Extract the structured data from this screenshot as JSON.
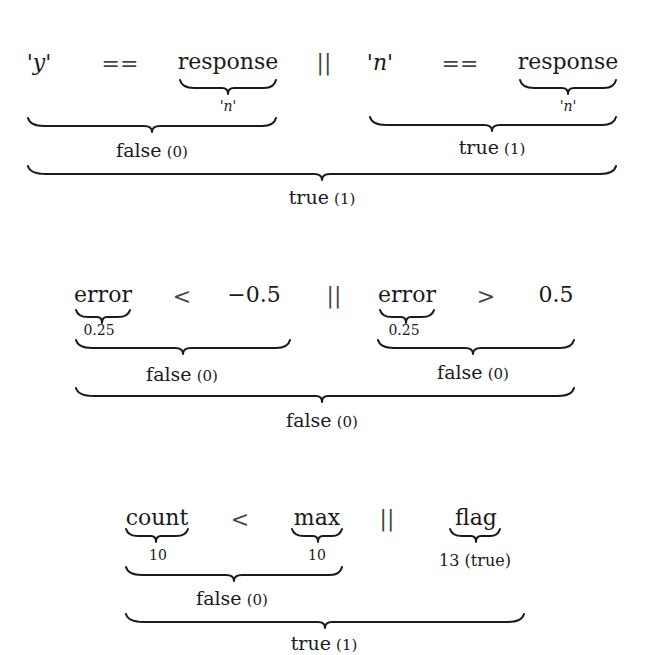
{
  "expressions": [
    {
      "tokens": {
        "lhs1": "'y'",
        "op1": "==",
        "rhs1": "response",
        "or": "||",
        "lhs2": "'n'",
        "op2": "==",
        "rhs2": "response"
      },
      "annotations": {
        "rhs1_value": "'n'",
        "rhs2_value": "'n'"
      },
      "left_result": {
        "label": "false",
        "value": "(0)"
      },
      "right_result": {
        "label": "true",
        "value": "(1)"
      },
      "overall_result": {
        "label": "true",
        "value": "(1)"
      }
    },
    {
      "tokens": {
        "lhs1": "error",
        "op1": "<",
        "rhs1": "−0.5",
        "or": "||",
        "lhs2": "error",
        "op2": ">",
        "rhs2": "0.5"
      },
      "annotations": {
        "lhs1_value": "0.25",
        "lhs2_value": "0.25"
      },
      "left_result": {
        "label": "false",
        "value": "(0)"
      },
      "right_result": {
        "label": "false",
        "value": "(0)"
      },
      "overall_result": {
        "label": "false",
        "value": "(0)"
      }
    },
    {
      "tokens": {
        "lhs1": "count",
        "op1": "<",
        "rhs1": "max",
        "or": "||",
        "operand2": "flag"
      },
      "annotations": {
        "lhs1_value": "10",
        "rhs1_value": "10",
        "operand2_value": "13 (true)"
      },
      "left_result": {
        "label": "false",
        "value": "(0)"
      },
      "overall_result": {
        "label": "true",
        "value": "(1)"
      }
    }
  ]
}
